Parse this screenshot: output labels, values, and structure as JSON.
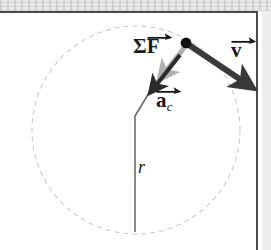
{
  "figure": {
    "background_color": "#ffffff",
    "frame_color": "#4a4a4c",
    "scan_band_color": "#e9e9ea"
  },
  "circle": {
    "name": "dashed-orbit-circle",
    "center_x": 136,
    "center_y": 130,
    "radius": 104,
    "stroke_color": "#cdc8d6",
    "dash_pattern": "5 4",
    "stroke_width": 1.1
  },
  "particle": {
    "name": "particle-dot",
    "x": 186,
    "y": 43,
    "radius": 5.4,
    "color": "#111111"
  },
  "vectors": [
    {
      "id": "sum-f",
      "label": "ΣF",
      "label_symbol": "Σ",
      "label_letter": "F",
      "has_vector_accent": true,
      "color": "#b0b0b0",
      "x1": 184,
      "y1": 48,
      "x2": 165,
      "y2": 72,
      "width": 5,
      "label_x": 133,
      "label_y": 36
    },
    {
      "id": "a-c",
      "label": "a",
      "label_letter": "a",
      "subscript": "c",
      "has_vector_accent": true,
      "color": "#2b2b2b",
      "x1": 180,
      "y1": 55,
      "x2": 155,
      "y2": 86,
      "width": 4,
      "label_x": 156,
      "label_y": 90
    },
    {
      "id": "v",
      "label": "v",
      "label_letter": "v",
      "has_vector_accent": true,
      "color": "#3a3a3a",
      "x1": 189,
      "y1": 45,
      "x2": 246,
      "y2": 84,
      "width": 6,
      "label_x": 231,
      "label_y": 40
    }
  ],
  "radius_line": {
    "name": "radius-indicator",
    "label": "r",
    "label_x": 138,
    "label_y": 158,
    "color": "#6b6b6b",
    "stroke_width": 1.6,
    "points": "152,88 135,116 135,232"
  }
}
